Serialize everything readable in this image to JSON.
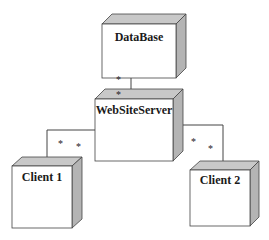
{
  "diagram": {
    "type": "UML deployment diagram",
    "colors": {
      "face": "#ffffff",
      "top": "#c8c8c8",
      "side": "#b4b4b4",
      "stroke": "#444444",
      "line": "#444444"
    },
    "nodes": [
      {
        "id": "database",
        "label": "DataBase"
      },
      {
        "id": "websiteserver",
        "label": "WebSiteServer"
      },
      {
        "id": "client1",
        "label": "Client 1"
      },
      {
        "id": "client2",
        "label": "Client 2"
      }
    ],
    "connections": [
      {
        "from": "database",
        "to": "websiteserver",
        "source_multiplicity": "*",
        "target_multiplicity": "*"
      },
      {
        "from": "websiteserver",
        "to": "client1",
        "source_multiplicity": "*",
        "target_multiplicity": "*"
      },
      {
        "from": "websiteserver",
        "to": "client2",
        "source_multiplicity": "*",
        "target_multiplicity": "*"
      }
    ]
  }
}
